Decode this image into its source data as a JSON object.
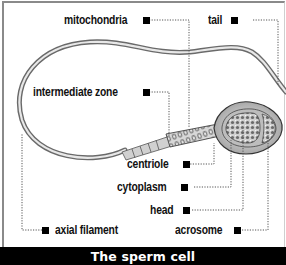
{
  "diagram": {
    "title": "The sperm cell",
    "labels": {
      "mitochondria": "mitochondria",
      "tail": "tail",
      "intermediate_zone": "intermediate zone",
      "centriole": "centriole",
      "cytoplasm": "cytoplasm",
      "head": "head",
      "acrosome": "acrosome",
      "axial_filament": "axial filament"
    },
    "colors": {
      "background": "#ffffff",
      "footer_bg": "#000000",
      "footer_text": "#ffffff",
      "label_text": "#111111",
      "leader_line": "#555555",
      "tail_stroke": "#9a9a9a",
      "head_fill": "#dedede"
    }
  }
}
